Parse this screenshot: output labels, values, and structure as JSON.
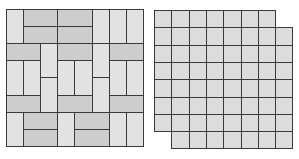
{
  "figure": {
    "left_pattern": {
      "name": "basketweave-pinwheel paving pattern",
      "grid_units": [
        8,
        8
      ],
      "unit_px": 17.1,
      "origin": [
        6,
        9
      ],
      "colors": {
        "vertical": "#e2e2e2",
        "horizontal": "#cdcdcd",
        "stroke": "#3a3a3a"
      },
      "tiles": [
        {
          "c": 0,
          "r": 0,
          "w": 1,
          "h": 2,
          "t": "v"
        },
        {
          "c": 1,
          "r": 0,
          "w": 2,
          "h": 1,
          "t": "h"
        },
        {
          "c": 3,
          "r": 0,
          "w": 2,
          "h": 1,
          "t": "h"
        },
        {
          "c": 1,
          "r": 1,
          "w": 2,
          "h": 1,
          "t": "h"
        },
        {
          "c": 3,
          "r": 1,
          "w": 2,
          "h": 1,
          "t": "h"
        },
        {
          "c": 5,
          "r": 0,
          "w": 1,
          "h": 2,
          "t": "v"
        },
        {
          "c": 6,
          "r": 0,
          "w": 1,
          "h": 2,
          "t": "v"
        },
        {
          "c": 7,
          "r": 0,
          "w": 1,
          "h": 2,
          "t": "v"
        },
        {
          "c": 0,
          "r": 2,
          "w": 2,
          "h": 1,
          "t": "h"
        },
        {
          "c": 2,
          "r": 2,
          "w": 1,
          "h": 2,
          "t": "v"
        },
        {
          "c": 3,
          "r": 2,
          "w": 2,
          "h": 1,
          "t": "h"
        },
        {
          "c": 5,
          "r": 2,
          "w": 1,
          "h": 2,
          "t": "v"
        },
        {
          "c": 6,
          "r": 2,
          "w": 2,
          "h": 1,
          "t": "h"
        },
        {
          "c": 0,
          "r": 3,
          "w": 1,
          "h": 2,
          "t": "v"
        },
        {
          "c": 1,
          "r": 3,
          "w": 1,
          "h": 2,
          "t": "v"
        },
        {
          "c": 3,
          "r": 3,
          "w": 1,
          "h": 2,
          "t": "v"
        },
        {
          "c": 4,
          "r": 3,
          "w": 1,
          "h": 2,
          "t": "v"
        },
        {
          "c": 6,
          "r": 3,
          "w": 1,
          "h": 2,
          "t": "v"
        },
        {
          "c": 7,
          "r": 3,
          "w": 1,
          "h": 2,
          "t": "v"
        },
        {
          "c": 2,
          "r": 4,
          "w": 1,
          "h": 2,
          "t": "v"
        },
        {
          "c": 5,
          "r": 4,
          "w": 1,
          "h": 2,
          "t": "v"
        },
        {
          "c": 0,
          "r": 5,
          "w": 2,
          "h": 1,
          "t": "h"
        },
        {
          "c": 3,
          "r": 5,
          "w": 2,
          "h": 1,
          "t": "h"
        },
        {
          "c": 6,
          "r": 5,
          "w": 2,
          "h": 1,
          "t": "h"
        },
        {
          "c": 0,
          "r": 6,
          "w": 1,
          "h": 2,
          "t": "v"
        },
        {
          "c": 1,
          "r": 6,
          "w": 2,
          "h": 1,
          "t": "h"
        },
        {
          "c": 1,
          "r": 7,
          "w": 2,
          "h": 1,
          "t": "h"
        },
        {
          "c": 3,
          "r": 6,
          "w": 1,
          "h": 2,
          "t": "v"
        },
        {
          "c": 4,
          "r": 6,
          "w": 2,
          "h": 1,
          "t": "h"
        },
        {
          "c": 4,
          "r": 7,
          "w": 2,
          "h": 1,
          "t": "h"
        },
        {
          "c": 6,
          "r": 6,
          "w": 1,
          "h": 2,
          "t": "v"
        },
        {
          "c": 7,
          "r": 6,
          "w": 1,
          "h": 2,
          "t": "v"
        }
      ]
    },
    "right_pattern": {
      "name": "square grid with offset rows",
      "grid_units": [
        8,
        8
      ],
      "unit_px": 17.3,
      "origin": [
        154,
        10
      ],
      "colors": {
        "fill": "#dcdcdc",
        "stroke": "#3a3a3a"
      },
      "rows": [
        {
          "r": 0,
          "start": 0,
          "count": 7
        },
        {
          "r": 1,
          "start": 0,
          "count": 8
        },
        {
          "r": 2,
          "start": 0,
          "count": 8
        },
        {
          "r": 3,
          "start": 0,
          "count": 8
        },
        {
          "r": 4,
          "start": 0,
          "count": 8
        },
        {
          "r": 5,
          "start": 0,
          "count": 8
        },
        {
          "r": 6,
          "start": 0,
          "count": 8
        },
        {
          "r": 7,
          "start": 1,
          "count": 7
        }
      ]
    }
  }
}
